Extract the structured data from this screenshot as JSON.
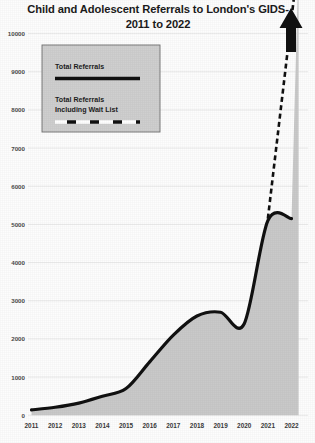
{
  "chart_data": {
    "type": "area",
    "title": "Child and Adolescent Referrals to London's GIDS- 2011 to 2022",
    "title_line1": "Child and Adolescent Referrals to London's GIDS-",
    "title_line2": "2011 to 2022",
    "xlabel": "",
    "ylabel": "",
    "categories": [
      "2011",
      "2012",
      "2013",
      "2014",
      "2015",
      "2016",
      "2017",
      "2018",
      "2019",
      "2020",
      "2021",
      "2022"
    ],
    "x": [
      2011,
      2012,
      2013,
      2014,
      2015,
      2016,
      2017,
      2018,
      2019,
      2020,
      2021,
      2022
    ],
    "ylim": [
      0,
      10000
    ],
    "xlim": [
      2011,
      2022
    ],
    "yticks": [
      0,
      1000,
      2000,
      3000,
      4000,
      5000,
      6000,
      7000,
      8000,
      9000,
      10000
    ],
    "ytick_labels": [
      "0",
      "1000",
      "2000",
      "3000",
      "4000",
      "5000",
      "6000",
      "7000",
      "8000",
      "9000",
      "10000"
    ],
    "grid": true,
    "legend_position": "upper-left",
    "series": [
      {
        "name": "Total Referrals",
        "style": "solid",
        "color": "#111111",
        "values": [
          140,
          210,
          320,
          500,
          700,
          1400,
          2100,
          2600,
          2700,
          2400,
          5100,
          5150
        ]
      },
      {
        "name": "Total Referrals Including Wait List",
        "style": "dashed",
        "color": "#111111",
        "values": [
          null,
          null,
          null,
          null,
          null,
          null,
          null,
          null,
          null,
          null,
          5150,
          10400
        ]
      }
    ],
    "annotations": [
      {
        "name": "up-arrow",
        "label": "",
        "description": "thick upward arrow at end of dashed projection line"
      }
    ],
    "area_fill_color": "#c9c9c9",
    "background_color": "#fdfdfd"
  },
  "legend": {
    "entries": [
      {
        "label": "Total Referrals",
        "style": "solid"
      },
      {
        "label": "Total Referrals Including Wait List",
        "label_line1": "Total Referrals",
        "label_line2": "Including Wait List",
        "style": "dashed"
      }
    ]
  }
}
